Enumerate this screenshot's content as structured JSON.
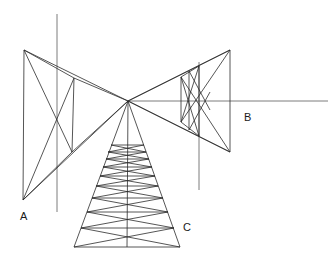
{
  "diagram": {
    "type": "line-drawing",
    "width": 330,
    "height": 264,
    "background_color": "#ffffff",
    "stroke_color": "#2b2b2b",
    "stroke_width": 0.8,
    "labels": [
      {
        "text": "A",
        "x": 20,
        "y": 220
      },
      {
        "text": "B",
        "x": 244,
        "y": 121
      },
      {
        "text": "C",
        "x": 183,
        "y": 231
      }
    ],
    "points": {
      "vanishing_point": {
        "x": 128,
        "y": 101
      },
      "left_top_outer": {
        "x": 24,
        "y": 50
      },
      "left_bottom_outer": {
        "x": 23,
        "y": 200
      },
      "left_top_inner": {
        "x": 74,
        "y": 78
      },
      "left_bottom_inner": {
        "x": 72,
        "y": 152
      },
      "right_top_outer": {
        "x": 230,
        "y": 50
      },
      "right_bottom_outer": {
        "x": 230,
        "y": 152
      },
      "right_top_inner": {
        "x": 181,
        "y": 77
      },
      "right_bottom_inner": {
        "x": 181,
        "y": 122
      },
      "right_top_inner2": {
        "x": 199,
        "y": 66
      },
      "right_bottom_inner2": {
        "x": 199,
        "y": 136
      },
      "tower_base_left": {
        "x": 74,
        "y": 247
      },
      "tower_base_right": {
        "x": 180,
        "y": 247
      },
      "tower_apex": {
        "x": 128,
        "y": 101
      }
    },
    "reference_lines": {
      "horizon": {
        "x1": 128,
        "y1": 101,
        "x2": 328,
        "y2": 101
      },
      "vertical_left": {
        "x": 57,
        "y1": 14,
        "y2": 212
      },
      "vertical_right": {
        "x": 199,
        "y1": 62,
        "y2": 190
      }
    },
    "tower_rungs_y": [
      145,
      152,
      159,
      167,
      176,
      186,
      198,
      212,
      228,
      247
    ],
    "counts": {
      "labels": 3,
      "tower_rungs": 10,
      "vertical_reference_lines": 2
    }
  }
}
